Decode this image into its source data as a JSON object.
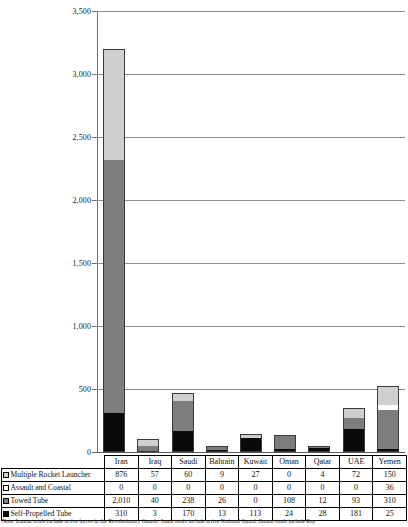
{
  "chart_data": {
    "type": "bar",
    "stacked": true,
    "title": "",
    "xlabel": "",
    "ylabel": "",
    "ylim": [
      0,
      3500
    ],
    "ytick_step": 500,
    "ytick_labels": [
      "3,500",
      "3,000",
      "2,500",
      "2,000",
      "1,500",
      "1,000",
      "500",
      "0"
    ],
    "ytick_values": [
      3500,
      3000,
      2500,
      2000,
      1500,
      1000,
      500,
      0
    ],
    "grid": true,
    "legend_position": "table-row-headers",
    "categories": [
      "Iran",
      "Iraq",
      "Saudi",
      "Bahrain",
      "Kuwait",
      "Oman",
      "Qatar",
      "UAE",
      "Yemen"
    ],
    "series": [
      {
        "name": "Self-Propelled Tube",
        "color": "#0a0a0a",
        "values": [
          310,
          3,
          170,
          13,
          113,
          24,
          28,
          181,
          25
        ],
        "labels": [
          "310",
          "3",
          "170",
          "13",
          "113",
          "24",
          "28",
          "181",
          "25"
        ]
      },
      {
        "name": "Towed Tube",
        "color": "#7d7d7d",
        "values": [
          2010,
          40,
          238,
          26,
          0,
          108,
          12,
          93,
          310
        ],
        "labels": [
          "2,010",
          "40",
          "238",
          "26",
          "0",
          "108",
          "12",
          "93",
          "310"
        ]
      },
      {
        "name": "Assault and Coastal",
        "color": "#ffffff",
        "values": [
          0,
          0,
          0,
          0,
          0,
          0,
          0,
          0,
          36
        ],
        "labels": [
          "0",
          "0",
          "0",
          "0",
          "0",
          "0",
          "0",
          "0",
          "36"
        ]
      },
      {
        "name": "Multiple Rocket Launcher",
        "color": "#cfcfcf",
        "values": [
          876,
          57,
          60,
          9,
          27,
          0,
          4,
          72,
          150
        ],
        "labels": [
          "876",
          "57",
          "60",
          "9",
          "27",
          "0",
          "4",
          "72",
          "150"
        ]
      }
    ]
  },
  "table": {
    "column_headers": [
      "Iran",
      "Iraq",
      "Saudi",
      "Bahrain",
      "Kuwait",
      "Oman",
      "Qatar",
      "UAE",
      "Yemen"
    ],
    "rows": [
      {
        "label": "Multiple Rocket Launcher",
        "swatch": "light-gray",
        "values": [
          "876",
          "57",
          "60",
          "9",
          "27",
          "0",
          "4",
          "72",
          "150"
        ]
      },
      {
        "label": "Assault and Coastal",
        "swatch": "white",
        "values": [
          "0",
          "0",
          "0",
          "0",
          "0",
          "0",
          "0",
          "0",
          "36"
        ]
      },
      {
        "label": "Towed Tube",
        "swatch": "dark-gray",
        "values": [
          "2,010",
          "40",
          "238",
          "26",
          "0",
          "108",
          "12",
          "93",
          "310"
        ]
      },
      {
        "label": "Self-Propelled Tube",
        "swatch": "black",
        "values": [
          "310",
          "3",
          "170",
          "13",
          "113",
          "24",
          "28",
          "181",
          "25"
        ]
      }
    ]
  },
  "note": "Note: Iranian totals include active forces in the Revolutionary Guards. Saudi totals include active National Guard. Omani totals include Roy"
}
